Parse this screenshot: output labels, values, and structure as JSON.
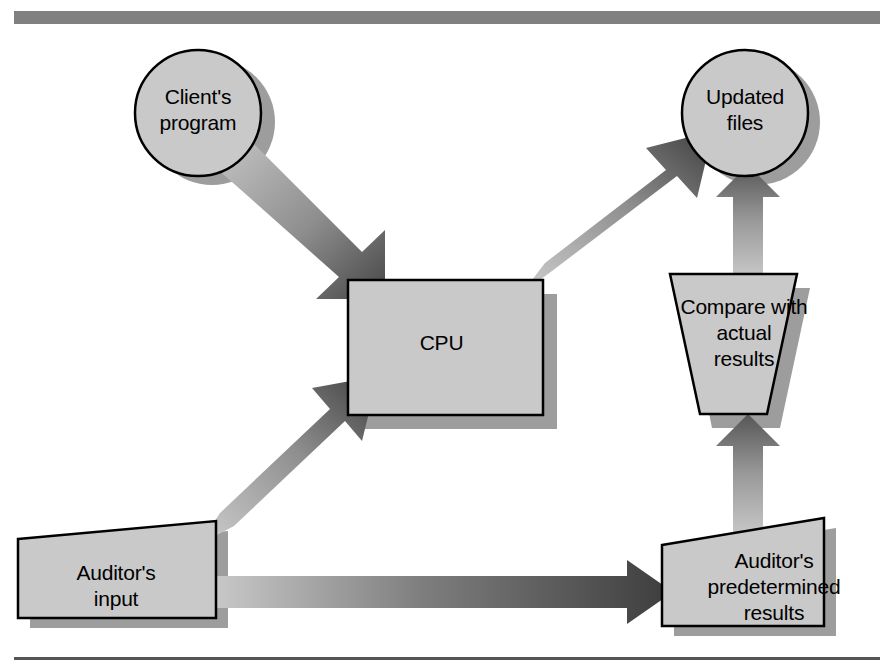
{
  "figure": {
    "type": "flowchart",
    "title_bar": {
      "name": "top-rule",
      "color": "#808080"
    },
    "bottom_rule": {
      "name": "bottom-rule",
      "color": "#555555"
    },
    "palette": {
      "shape_fill": "#c9c9c9",
      "shape_stroke": "#000000",
      "shadow": "#9a9a9a",
      "arrow_dark": "#4a4a4a",
      "arrow_light": "#c2c2c2",
      "background": "#ffffff"
    }
  },
  "nodes": {
    "client_program": {
      "label": "Client's\nprogram",
      "shape": "circle"
    },
    "updated_files": {
      "label": "Updated\nfiles",
      "shape": "circle"
    },
    "cpu": {
      "label": "CPU",
      "shape": "rectangle"
    },
    "compare": {
      "label": "Compare with\nactual\nresults",
      "shape": "inverted-trapezoid"
    },
    "auditors_input": {
      "label": "Auditor's\ninput",
      "shape": "input-parallelogram"
    },
    "auditors_predetermined": {
      "label": "Auditor's\npredetermined\nresults",
      "shape": "input-parallelogram"
    }
  },
  "edges": [
    {
      "name": "edge-client-to-cpu",
      "from": "client_program",
      "to": "cpu",
      "direction": "down-right"
    },
    {
      "name": "edge-cpu-to-updated",
      "from": "cpu",
      "to": "updated_files",
      "direction": "up-right"
    },
    {
      "name": "edge-input-to-cpu",
      "from": "auditors_input",
      "to": "cpu",
      "direction": "up-right"
    },
    {
      "name": "edge-input-to-predet",
      "from": "auditors_input",
      "to": "auditors_predetermined",
      "direction": "right"
    },
    {
      "name": "edge-predet-to-compare",
      "from": "auditors_predetermined",
      "to": "compare",
      "direction": "up"
    },
    {
      "name": "edge-compare-to-updated",
      "from": "compare",
      "to": "updated_files",
      "direction": "up"
    }
  ]
}
